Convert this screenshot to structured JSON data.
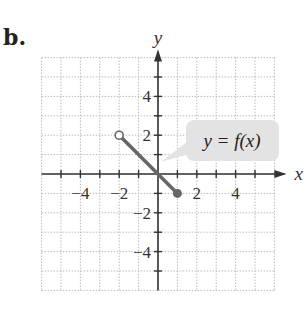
{
  "figure": {
    "part_label": "b.",
    "callout": "y = f(x)",
    "colors": {
      "line": "#666666",
      "grid": "#bbbbbb",
      "axis": "#333333",
      "callout_bg": "#e3e3e3"
    }
  },
  "chart_data": {
    "type": "line",
    "title": "",
    "xlabel": "x",
    "ylabel": "y",
    "xlim": [
      -6,
      6
    ],
    "ylim": [
      -6,
      6
    ],
    "grid": true,
    "x_tick_labels": [
      "-4",
      "-2",
      "2",
      "4"
    ],
    "y_tick_labels": [
      "4",
      "2",
      "-2",
      "-4"
    ],
    "series": [
      {
        "name": "y = f(x)",
        "x": [
          -2,
          1
        ],
        "y": [
          2,
          -1
        ]
      }
    ],
    "endpoints": [
      {
        "x": -2,
        "y": 2,
        "style": "open"
      },
      {
        "x": 1,
        "y": -1,
        "style": "closed"
      }
    ],
    "annotations": [
      "y = f(x)"
    ]
  }
}
